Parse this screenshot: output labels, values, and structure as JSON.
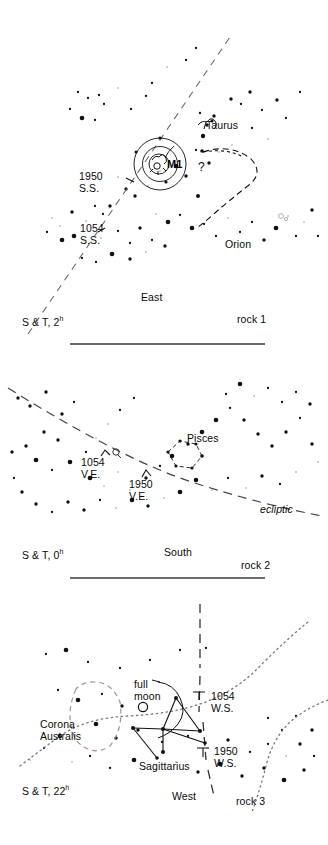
{
  "figure": {
    "kind": "three-panel-star-chart",
    "background": "#ffffff",
    "ink": "#000000",
    "line_color": "#555555"
  },
  "panels": [
    {
      "id": "panel-1",
      "rock_label": "rock 1",
      "time_label_prefix": "S & T, 2",
      "time_label_sup": "h",
      "direction": "East",
      "constellations": [
        "Taurus",
        "Orion"
      ],
      "markers": [
        {
          "name": "M1",
          "label": "M1"
        },
        {
          "name": "1950-summer-solstice",
          "line1": "1950",
          "line2": "S.S."
        },
        {
          "name": "1054-summer-solstice",
          "line1": "1054",
          "line2": "S.S."
        },
        {
          "name": "query",
          "label": "?"
        }
      ]
    },
    {
      "id": "panel-2",
      "rock_label": "rock 2",
      "time_label_prefix": "S & T, 0",
      "time_label_sup": "h",
      "direction": "South",
      "constellations": [
        "Pisces"
      ],
      "ecliptic_label": "ecliptic",
      "markers": [
        {
          "name": "1054-vernal-equinox",
          "line1": "1054",
          "line2": "V.E."
        },
        {
          "name": "1950-vernal-equinox",
          "line1": "1950",
          "line2": "V.E."
        }
      ]
    },
    {
      "id": "panel-3",
      "rock_label": "rock 3",
      "time_label_prefix": "S & T, 22",
      "time_label_sup": "h",
      "direction": "West",
      "constellations": [
        "Corona Australis",
        "Sagittarius"
      ],
      "moon_label_line1": "full",
      "moon_label_line2": "moon",
      "markers": [
        {
          "name": "1054-winter-solstice",
          "line1": "1054",
          "line2": "W.S."
        },
        {
          "name": "1950-winter-solstice",
          "line1": "1950",
          "line2": "W.S."
        }
      ]
    }
  ],
  "labels": {
    "p1_taurus": "Taurus",
    "p1_orion": "Orion",
    "p1_m1": "M1",
    "p1_q": "?",
    "p1_1950a": "1950",
    "p1_1950b": "S.S.",
    "p1_1054a": "1054",
    "p1_1054b": "S.S.",
    "p1_east": "East",
    "p1_st": "S & T, 2",
    "p1_st_sup": "h",
    "p1_rock": "rock 1",
    "p2_pisces": "Pisces",
    "p2_1054a": "1054",
    "p2_1054b": "V.E.",
    "p2_1950a": "1950",
    "p2_1950b": "V.E.",
    "p2_ecliptic": "ecliptic",
    "p2_south": "South",
    "p2_st": "S & T, 0",
    "p2_st_sup": "h",
    "p2_rock": "rock 2",
    "p3_fullmoon_a": "full",
    "p3_fullmoon_b": "moon",
    "p3_corona_a": "Corona",
    "p3_corona_b": "Australis",
    "p3_sagittarius": "Sagittarius",
    "p3_1054a": "1054",
    "p3_1054b": "W.S.",
    "p3_1950a": "1950",
    "p3_1950b": "W.S.",
    "p3_west": "West",
    "p3_st": "S & T, 22",
    "p3_st_sup": "h",
    "p3_rock": "rock 3"
  },
  "chart_data": {
    "type": "scatter",
    "xlabel": "",
    "ylabel": "",
    "panel1_stars": [
      [
        78,
        92
      ],
      [
        88,
        98
      ],
      [
        99,
        95
      ],
      [
        104,
        104
      ],
      [
        118,
        88
      ],
      [
        70,
        109
      ],
      [
        82,
        118
      ],
      [
        95,
        120
      ],
      [
        131,
        109
      ],
      [
        146,
        96
      ],
      [
        152,
        83
      ],
      [
        167,
        67
      ],
      [
        186,
        60
      ],
      [
        196,
        48
      ],
      [
        200,
        113
      ],
      [
        207,
        125
      ],
      [
        214,
        116
      ],
      [
        231,
        99
      ],
      [
        241,
        104
      ],
      [
        250,
        92
      ],
      [
        262,
        110
      ],
      [
        277,
        100
      ],
      [
        286,
        118
      ],
      [
        300,
        92
      ],
      [
        252,
        128
      ],
      [
        268,
        139
      ],
      [
        232,
        145
      ],
      [
        219,
        152
      ],
      [
        209,
        163
      ],
      [
        196,
        150
      ],
      [
        186,
        176
      ],
      [
        176,
        166
      ],
      [
        160,
        171
      ],
      [
        148,
        186
      ],
      [
        135,
        196
      ],
      [
        126,
        189
      ],
      [
        118,
        177
      ],
      [
        110,
        206
      ],
      [
        103,
        214
      ],
      [
        95,
        206
      ],
      [
        86,
        221
      ],
      [
        72,
        212
      ],
      [
        60,
        226
      ],
      [
        52,
        218
      ],
      [
        47,
        232
      ],
      [
        62,
        240
      ],
      [
        74,
        236
      ],
      [
        101,
        238
      ],
      [
        118,
        231
      ],
      [
        130,
        243
      ],
      [
        140,
        228
      ],
      [
        152,
        240
      ],
      [
        156,
        214
      ],
      [
        168,
        222
      ],
      [
        180,
        215
      ],
      [
        192,
        228
      ],
      [
        204,
        224
      ],
      [
        216,
        236
      ],
      [
        228,
        218
      ],
      [
        240,
        232
      ],
      [
        252,
        222
      ],
      [
        264,
        240
      ],
      [
        276,
        228
      ],
      [
        288,
        216
      ],
      [
        296,
        236
      ],
      [
        304,
        222
      ],
      [
        312,
        210
      ],
      [
        318,
        236
      ],
      [
        165,
        246
      ],
      [
        146,
        252
      ],
      [
        130,
        259
      ],
      [
        112,
        254
      ],
      [
        96,
        262
      ],
      [
        82,
        258
      ]
    ],
    "panel2_stars": [
      [
        18,
        398
      ],
      [
        30,
        406
      ],
      [
        46,
        392
      ],
      [
        62,
        414
      ],
      [
        74,
        402
      ],
      [
        44,
        432
      ],
      [
        58,
        440
      ],
      [
        26,
        446
      ],
      [
        12,
        452
      ],
      [
        36,
        460
      ],
      [
        52,
        470
      ],
      [
        70,
        462
      ],
      [
        86,
        452
      ],
      [
        96,
        438
      ],
      [
        108,
        424
      ],
      [
        120,
        410
      ],
      [
        134,
        398
      ],
      [
        90,
        478
      ],
      [
        104,
        486
      ],
      [
        118,
        472
      ],
      [
        130,
        490
      ],
      [
        146,
        478
      ],
      [
        160,
        466
      ],
      [
        172,
        456
      ],
      [
        188,
        444
      ],
      [
        202,
        432
      ],
      [
        216,
        420
      ],
      [
        230,
        408
      ],
      [
        244,
        420
      ],
      [
        258,
        434
      ],
      [
        272,
        446
      ],
      [
        286,
        432
      ],
      [
        300,
        418
      ],
      [
        312,
        444
      ],
      [
        318,
        462
      ],
      [
        296,
        472
      ],
      [
        280,
        484
      ],
      [
        262,
        476
      ],
      [
        246,
        488
      ],
      [
        228,
        478
      ],
      [
        212,
        490
      ],
      [
        196,
        480
      ],
      [
        180,
        492
      ],
      [
        164,
        498
      ],
      [
        148,
        506
      ],
      [
        132,
        500
      ],
      [
        116,
        508
      ],
      [
        100,
        500
      ],
      [
        84,
        510
      ],
      [
        68,
        502
      ],
      [
        52,
        512
      ],
      [
        36,
        504
      ],
      [
        22,
        492
      ],
      [
        14,
        478
      ],
      [
        226,
        394
      ],
      [
        240,
        384
      ],
      [
        254,
        396
      ],
      [
        268,
        388
      ],
      [
        282,
        402
      ],
      [
        296,
        392
      ],
      [
        310,
        404
      ]
    ],
    "panel3_stars": [
      [
        46,
        654
      ],
      [
        66,
        650
      ],
      [
        88,
        662
      ],
      [
        120,
        668
      ],
      [
        150,
        660
      ],
      [
        180,
        650
      ],
      [
        206,
        648
      ],
      [
        58,
        690
      ],
      [
        78,
        700
      ],
      [
        102,
        694
      ],
      [
        122,
        706
      ],
      [
        96,
        724
      ],
      [
        116,
        738
      ],
      [
        138,
        730
      ],
      [
        162,
        742
      ],
      [
        188,
        736
      ],
      [
        208,
        748
      ],
      [
        228,
        740
      ],
      [
        250,
        752
      ],
      [
        268,
        744
      ],
      [
        286,
        756
      ],
      [
        60,
        736
      ],
      [
        44,
        748
      ],
      [
        30,
        760
      ],
      [
        72,
        762
      ],
      [
        90,
        756
      ],
      [
        110,
        768
      ],
      [
        134,
        760
      ],
      [
        156,
        770
      ],
      [
        176,
        762
      ],
      [
        198,
        772
      ],
      [
        220,
        764
      ],
      [
        242,
        776
      ],
      [
        264,
        768
      ],
      [
        284,
        780
      ],
      [
        304,
        770
      ],
      [
        314,
        756
      ],
      [
        300,
        744
      ],
      [
        312,
        730
      ],
      [
        296,
        716
      ],
      [
        282,
        730
      ],
      [
        268,
        718
      ]
    ]
  }
}
